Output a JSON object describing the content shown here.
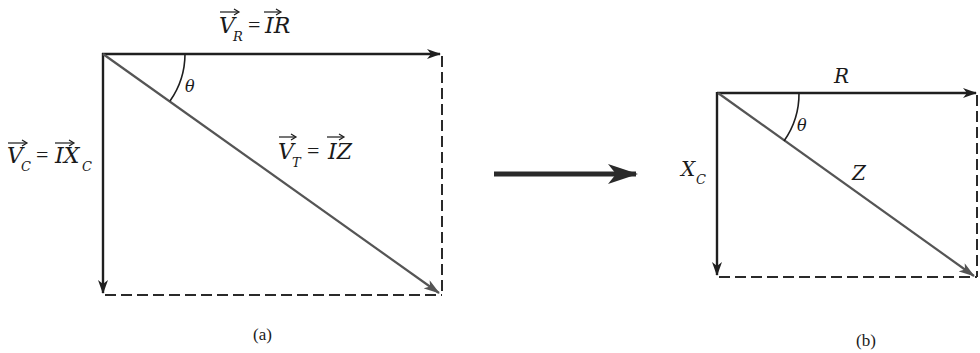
{
  "diagram_a": {
    "caption": "(a)",
    "labels": {
      "vr_lhs": "V",
      "vr_lhs_sub": "R",
      "vr_eq": "=",
      "vr_rhs": "IR",
      "vc_lhs": "V",
      "vc_lhs_sub": "C",
      "vc_eq": "=",
      "vc_rhs": "IX",
      "vc_rhs_sub": "C",
      "vt_lhs": "V",
      "vt_lhs_sub": "T",
      "vt_eq": "=",
      "vt_rhs": "IZ",
      "angle": "θ"
    }
  },
  "transform_arrow": {
    "description": "arrow from (a) to (b)"
  },
  "diagram_b": {
    "caption": "(b)",
    "labels": {
      "r": "R",
      "xc": "X",
      "xc_sub": "C",
      "z": "Z",
      "angle": "θ"
    }
  },
  "colors": {
    "vector_dark": "#1f1f1f",
    "vector_gray": "#555555",
    "dashed": "#2a2a2a"
  }
}
